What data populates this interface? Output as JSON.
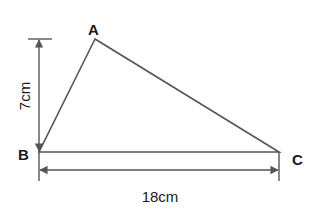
{
  "diagram": {
    "type": "triangle",
    "vertices": {
      "A": {
        "label": "A",
        "x": 95,
        "y": 39
      },
      "B": {
        "label": "B",
        "x": 39,
        "y": 152
      },
      "C": {
        "label": "C",
        "x": 279,
        "y": 152
      }
    },
    "dimensions": {
      "height": {
        "label": "7cm",
        "value": 7,
        "unit": "cm"
      },
      "base": {
        "label": "18cm",
        "value": 18,
        "unit": "cm"
      }
    },
    "colors": {
      "line": "#555555",
      "text": "#1a1a1a"
    }
  }
}
